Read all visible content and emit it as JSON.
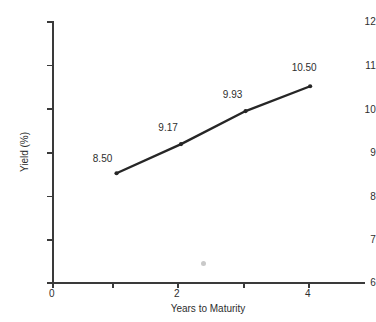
{
  "chart_data": {
    "type": "line",
    "title": "",
    "xlabel": "Years to Maturity",
    "ylabel": "Yield (%)",
    "x": [
      1,
      2,
      3,
      4
    ],
    "values": [
      8.5,
      9.17,
      9.93,
      10.5
    ],
    "point_labels": [
      "8.50",
      "9.17",
      "9.93",
      "10.50"
    ],
    "xlim": [
      0,
      4.85
    ],
    "ylim": [
      6,
      12
    ],
    "x_ticks": [
      0,
      1,
      2,
      3,
      4
    ],
    "x_tick_labels": [
      "0",
      "",
      "2",
      "",
      "4"
    ],
    "y_ticks": [
      6,
      7,
      8,
      9,
      10,
      11,
      12
    ],
    "y_tick_labels": [
      "6",
      "7",
      "8",
      "9",
      "10",
      "11",
      "12"
    ],
    "grid": false,
    "legend": "none",
    "series_color": "#262626",
    "axis_color": "#3a3a3a",
    "marker": "circle"
  }
}
